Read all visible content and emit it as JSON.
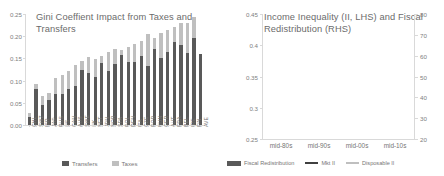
{
  "left_panel": {
    "title": "Gini Coeffient Impact from Taxes and Transfers",
    "legend": [
      {
        "label": "Transfers",
        "color": "#595959",
        "marker": "bar"
      },
      {
        "label": "Taxes",
        "color": "#bfbfbf",
        "marker": "bar"
      }
    ]
  },
  "right_panel": {
    "title": "Income Inequality (II, LHS) and Fiscal Redistribution (RHS)",
    "legend": [
      {
        "label": "Fiscal Redistribution",
        "color": "#595959",
        "marker": "bar"
      },
      {
        "label": "Mkt II",
        "color": "#404040",
        "marker": "line"
      },
      {
        "label": "Disposable II",
        "color": "#bfbfbf",
        "marker": "line"
      }
    ]
  },
  "chart_data": [
    {
      "type": "bar",
      "title": "Gini Coeffient Impact from Taxes and Transfers",
      "xlabel": "",
      "ylabel": "",
      "ylim": [
        0.0,
        0.25
      ],
      "yticks": [
        "0.00",
        "0.05",
        "0.10",
        "0.15",
        "0.20",
        "0.25"
      ],
      "grid": false,
      "legend_position": "bottom",
      "stacked": true,
      "categories": [
        "CHL",
        "SWZ",
        "ISR",
        "JAP",
        "RUS",
        "US",
        "CAN",
        "AUS",
        "SWE",
        "UK",
        "NET",
        "JPN",
        "NOR",
        "SPA",
        "POL",
        "DEN",
        "ITA",
        "CZE",
        "POR",
        "HUN",
        "GER",
        "AUT",
        "FRA",
        "BEL",
        "IRE",
        "FIN",
        "AVE"
      ],
      "series": [
        {
          "name": "Transfers",
          "color": "#595959",
          "values": [
            0.018,
            0.082,
            0.046,
            0.056,
            0.07,
            0.07,
            0.08,
            0.088,
            0.125,
            0.118,
            0.108,
            0.14,
            0.122,
            0.137,
            0.158,
            0.143,
            0.143,
            0.155,
            0.133,
            0.172,
            0.152,
            0.165,
            0.188,
            0.181,
            0.162,
            0.196,
            0.161
          ]
        },
        {
          "name": "Taxes",
          "color": "#bfbfbf",
          "values": [
            0.01,
            0.01,
            0.02,
            0.017,
            0.035,
            0.042,
            0.042,
            0.047,
            0.02,
            0.035,
            0.04,
            0.015,
            0.042,
            0.034,
            0.012,
            0.032,
            0.04,
            0.035,
            0.072,
            0.024,
            0.055,
            0.05,
            0.032,
            0.049,
            0.068,
            0.047,
            0.0
          ]
        }
      ]
    },
    {
      "type": "combo",
      "title": "Income Inequality (II, LHS) and Fiscal Redistribution (RHS)",
      "xlabel": "",
      "ylabel": "",
      "categories": [
        "mid-80s",
        "mid-90s",
        "mid-00s",
        "mid-10s"
      ],
      "ylim_left": [
        0.25,
        0.45
      ],
      "yticks_left": [
        "0.25",
        "0.3",
        "0.35",
        "0.4",
        "0.45"
      ],
      "ylim_right": [
        20,
        80
      ],
      "yticks_right": [
        "20",
        "30",
        "40",
        "50",
        "60",
        "70",
        "80"
      ],
      "grid": false,
      "legend_position": "bottom",
      "series": [
        {
          "name": "Fiscal Redistribution",
          "type": "bar",
          "axis": "right",
          "color": "#595959",
          "values": [
            null,
            71.0,
            52.0,
            49.0
          ]
        },
        {
          "name": "Mkt II",
          "type": "line",
          "axis": "left",
          "color": "#404040",
          "values": [
            0.358,
            0.39,
            0.392,
            0.417
          ]
        },
        {
          "name": "Disposable II",
          "type": "line",
          "axis": "left",
          "color": "#bfbfbf",
          "values": [
            0.272,
            0.283,
            0.294,
            0.309
          ]
        }
      ]
    }
  ]
}
